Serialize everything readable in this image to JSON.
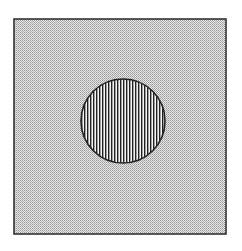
{
  "figure": {
    "square": {
      "fill_pattern": "checker-dots",
      "fill_color": "#c8c8c8",
      "border_color": "#333333"
    },
    "circle": {
      "fill_pattern": "vertical-stripes",
      "stripe_color": "#222222",
      "background_color": "#f4f4f4",
      "border_color": "#222222"
    }
  }
}
